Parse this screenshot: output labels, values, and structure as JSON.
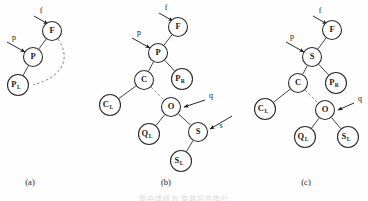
{
  "figure": {
    "kind": "binary-tree-rotation-diagram",
    "width": 368,
    "height": 201,
    "background_color": "#fefefe",
    "node_stroke_color": "#2b2b2b",
    "edge_color": "#454545",
    "dashed_edge_color": "#8a8a8a",
    "text_color": "#1a1a1a",
    "faint_footer_text": "图中虚线为 旋转后的指针"
  },
  "panels": [
    {
      "id": "a",
      "caption": "(a)",
      "caption_pos": {
        "x": 30,
        "y": 183
      },
      "nodes": [
        {
          "id": "a-F",
          "label": "F",
          "sub": "",
          "x": 52,
          "y": 31,
          "r": 9.5
        },
        {
          "id": "a-P",
          "label": "P",
          "sub": "",
          "x": 33,
          "y": 57,
          "r": 9.5
        },
        {
          "id": "a-PL",
          "label": "P",
          "sub": "L",
          "x": 18,
          "y": 85,
          "r": 10.5
        }
      ],
      "edges": [
        {
          "from": "a-F",
          "to": "a-P",
          "style": "solid"
        },
        {
          "from": "a-P",
          "to": "a-PL",
          "style": "solid"
        }
      ],
      "dashed_arcs": [
        {
          "from": "a-F",
          "to": "a-PL",
          "path": "M 58 39 C 70 56, 66 76, 33 85"
        }
      ],
      "pointers": [
        {
          "label": "f",
          "label_x": 41,
          "label_y": 11,
          "line": "M 34 16 L 48 24",
          "target": "a-F"
        },
        {
          "label": "p",
          "label_x": 14,
          "label_y": 38,
          "line": "M 7 42 L 25 52",
          "target": "a-P"
        }
      ]
    },
    {
      "id": "b",
      "caption": "(b)",
      "caption_pos": {
        "x": 166,
        "y": 183
      },
      "nodes": [
        {
          "id": "b-F",
          "label": "F",
          "sub": "",
          "x": 178,
          "y": 27,
          "r": 9.5
        },
        {
          "id": "b-P",
          "label": "P",
          "sub": "",
          "x": 158,
          "y": 53,
          "r": 9.5
        },
        {
          "id": "b-PR",
          "label": "P",
          "sub": "R",
          "x": 182,
          "y": 79,
          "r": 10.5
        },
        {
          "id": "b-C",
          "label": "C",
          "sub": "",
          "x": 144,
          "y": 80,
          "r": 9.5
        },
        {
          "id": "b-CL",
          "label": "C",
          "sub": "L",
          "x": 110,
          "y": 105,
          "r": 10.5
        },
        {
          "id": "b-O",
          "label": "O",
          "sub": "",
          "x": 171,
          "y": 107,
          "r": 9.5
        },
        {
          "id": "b-QL",
          "label": "Q",
          "sub": "L",
          "x": 149,
          "y": 134,
          "r": 10.5
        },
        {
          "id": "b-S",
          "label": "S",
          "sub": "",
          "x": 198,
          "y": 132,
          "r": 9.5
        },
        {
          "id": "b-SL",
          "label": "S",
          "sub": "L",
          "x": 181,
          "y": 161,
          "r": 10.5
        }
      ],
      "edges": [
        {
          "from": "b-F",
          "to": "b-P",
          "style": "solid"
        },
        {
          "from": "b-P",
          "to": "b-C",
          "style": "solid"
        },
        {
          "from": "b-P",
          "to": "b-PR",
          "style": "solid"
        },
        {
          "from": "b-C",
          "to": "b-CL",
          "style": "solid"
        },
        {
          "from": "b-O",
          "to": "b-QL",
          "style": "solid"
        },
        {
          "from": "b-O",
          "to": "b-S",
          "style": "solid"
        },
        {
          "from": "b-S",
          "to": "b-SL",
          "style": "solid"
        }
      ],
      "dashed_edges": [
        {
          "from": "b-C",
          "to": "b-O"
        }
      ],
      "pointers": [
        {
          "label": "f",
          "label_x": 166,
          "label_y": 8,
          "line": "M 159 13 L 173 21",
          "target": "b-F"
        },
        {
          "label": "p",
          "label_x": 139,
          "label_y": 33,
          "line": "M 132 38 L 150 48",
          "target": "b-P"
        },
        {
          "label": "q",
          "label_x": 211,
          "label_y": 96,
          "line": "M 205 100 L 184 107",
          "target": "b-O"
        },
        {
          "label": "s",
          "label_x": 221,
          "label_y": 126,
          "line": "M 232 116 L 210 129",
          "target": "b-S"
        }
      ]
    },
    {
      "id": "c",
      "caption": "(c)",
      "caption_pos": {
        "x": 306,
        "y": 183
      },
      "nodes": [
        {
          "id": "c-F",
          "label": "F",
          "sub": "",
          "x": 332,
          "y": 30,
          "r": 9.5
        },
        {
          "id": "c-S",
          "label": "S",
          "sub": "",
          "x": 312,
          "y": 57,
          "r": 9.5
        },
        {
          "id": "c-C",
          "label": "C",
          "sub": "",
          "x": 298,
          "y": 83,
          "r": 9.5
        },
        {
          "id": "c-PR",
          "label": "P",
          "sub": "R",
          "x": 336,
          "y": 83,
          "r": 10.5
        },
        {
          "id": "c-CL",
          "label": "C",
          "sub": "L",
          "x": 265,
          "y": 109,
          "r": 10.5
        },
        {
          "id": "c-O",
          "label": "O",
          "sub": "",
          "x": 325,
          "y": 110,
          "r": 9.5
        },
        {
          "id": "c-QL",
          "label": "Q",
          "sub": "L",
          "x": 305,
          "y": 137,
          "r": 10.5
        },
        {
          "id": "c-SL",
          "label": "S",
          "sub": "L",
          "x": 348,
          "y": 137,
          "r": 10.5
        }
      ],
      "edges": [
        {
          "from": "c-F",
          "to": "c-S",
          "style": "solid"
        },
        {
          "from": "c-S",
          "to": "c-C",
          "style": "solid"
        },
        {
          "from": "c-S",
          "to": "c-PR",
          "style": "solid"
        },
        {
          "from": "c-C",
          "to": "c-CL",
          "style": "solid"
        },
        {
          "from": "c-O",
          "to": "c-QL",
          "style": "solid"
        },
        {
          "from": "c-O",
          "to": "c-SL",
          "style": "solid"
        }
      ],
      "dashed_edges": [
        {
          "from": "c-C",
          "to": "c-O"
        }
      ],
      "pointers": [
        {
          "label": "f",
          "label_x": 320,
          "label_y": 11,
          "line": "M 313 16 L 327 24",
          "target": "c-F"
        },
        {
          "label": "p",
          "label_x": 292,
          "label_y": 37,
          "line": "M 286 42 L 304 52",
          "target": "c-S"
        },
        {
          "label": "q",
          "label_x": 360,
          "label_y": 99,
          "line": "M 354 103 L 338 110",
          "target": "c-O"
        }
      ]
    }
  ]
}
